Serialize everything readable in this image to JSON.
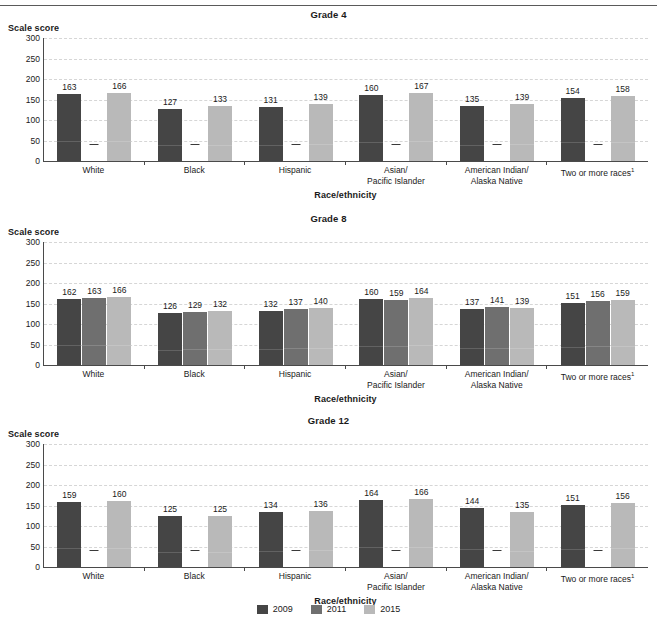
{
  "axis": {
    "ylabel": "Scale score",
    "xlabel": "Race/ethnicity",
    "yticks": [
      "300",
      "250",
      "200",
      "150",
      "100",
      "50",
      "0"
    ],
    "ymin": 0,
    "ymax": 300
  },
  "categories": [
    "White",
    "Black",
    "Hispanic",
    "Asian/\nPacific Islander",
    "American Indian/\nAlaska Native",
    "Two or more races"
  ],
  "category_lines": [
    [
      "White"
    ],
    [
      "Black"
    ],
    [
      "Hispanic"
    ],
    [
      "Asian/",
      "Pacific Islander"
    ],
    [
      "American Indian/",
      "Alaska Native"
    ],
    [
      "Two or more races",
      "footnote:1"
    ]
  ],
  "legend": {
    "position": "bottom-center",
    "items": [
      {
        "label": "2009",
        "color": "#454545"
      },
      {
        "label": "2011",
        "color": "#6f6f6f"
      },
      {
        "label": "2015",
        "color": "#b9b9b9"
      }
    ]
  },
  "panels": [
    {
      "key": "g4",
      "title": "Grade 4"
    },
    {
      "key": "g8",
      "title": "Grade 8"
    },
    {
      "key": "g12",
      "title": "Grade 12"
    }
  ],
  "no_data_marker": "—",
  "chart_data": [
    {
      "type": "bar",
      "title": "Grade 4",
      "xlabel": "Race/ethnicity",
      "ylabel": "Scale score",
      "ylim": [
        0,
        300
      ],
      "yticks": [
        0,
        50,
        100,
        150,
        200,
        250,
        300
      ],
      "grid": true,
      "legend_position": "bottom-center",
      "categories": [
        "White",
        "Black",
        "Hispanic",
        "Asian/Pacific Islander",
        "American Indian/Alaska Native",
        "Two or more races"
      ],
      "series": [
        {
          "name": "2009",
          "color": "#454545",
          "values": [
            163,
            127,
            131,
            160,
            135,
            154
          ]
        },
        {
          "name": "2011",
          "color": "#6f6f6f",
          "values": [
            null,
            null,
            null,
            null,
            null,
            null
          ]
        },
        {
          "name": "2015",
          "color": "#b9b9b9",
          "values": [
            166,
            133,
            139,
            167,
            139,
            158
          ]
        }
      ]
    },
    {
      "type": "bar",
      "title": "Grade 8",
      "xlabel": "Race/ethnicity",
      "ylabel": "Scale score",
      "ylim": [
        0,
        300
      ],
      "yticks": [
        0,
        50,
        100,
        150,
        200,
        250,
        300
      ],
      "grid": true,
      "legend_position": "bottom-center",
      "categories": [
        "White",
        "Black",
        "Hispanic",
        "Asian/Pacific Islander",
        "American Indian/Alaska Native",
        "Two or more races"
      ],
      "series": [
        {
          "name": "2009",
          "color": "#454545",
          "values": [
            162,
            126,
            132,
            160,
            137,
            151
          ]
        },
        {
          "name": "2011",
          "color": "#6f6f6f",
          "values": [
            163,
            129,
            137,
            159,
            141,
            156
          ]
        },
        {
          "name": "2015",
          "color": "#b9b9b9",
          "values": [
            166,
            132,
            140,
            164,
            139,
            159
          ]
        }
      ]
    },
    {
      "type": "bar",
      "title": "Grade 12",
      "xlabel": "Race/ethnicity",
      "ylabel": "Scale score",
      "ylim": [
        0,
        300
      ],
      "yticks": [
        0,
        50,
        100,
        150,
        200,
        250,
        300
      ],
      "grid": true,
      "legend_position": "bottom-center",
      "categories": [
        "White",
        "Black",
        "Hispanic",
        "Asian/Pacific Islander",
        "American Indian/Alaska Native",
        "Two or more races"
      ],
      "series": [
        {
          "name": "2009",
          "color": "#454545",
          "values": [
            159,
            125,
            134,
            164,
            144,
            151
          ]
        },
        {
          "name": "2011",
          "color": "#6f6f6f",
          "values": [
            null,
            null,
            null,
            null,
            null,
            null
          ]
        },
        {
          "name": "2015",
          "color": "#b9b9b9",
          "values": [
            160,
            125,
            136,
            166,
            135,
            156
          ]
        }
      ]
    }
  ]
}
